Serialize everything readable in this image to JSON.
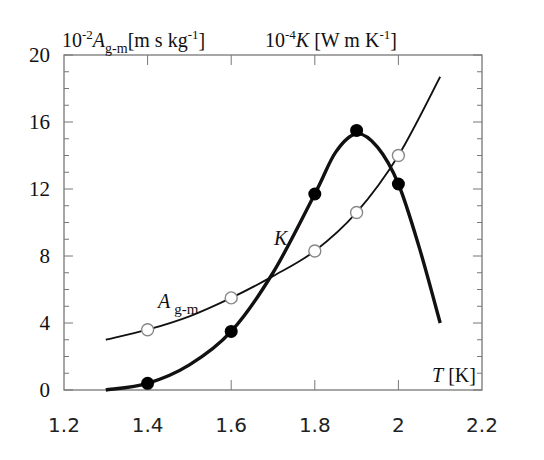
{
  "chart_data": {
    "type": "line",
    "title": "",
    "xlabel": "T [K]",
    "ylabel_left": "10^-2 A_g-m [m s kg^-1]",
    "ylabel_right": "10^-4 K [W m K^-1]",
    "xlim": [
      1.2,
      2.2
    ],
    "ylim": [
      0,
      20
    ],
    "x_ticks": [
      "1.2",
      "1.4",
      "1.6",
      "1.8",
      "2",
      "2.2"
    ],
    "y_ticks": [
      "0",
      "4",
      "8",
      "12",
      "16",
      "20"
    ],
    "grid": false,
    "series": [
      {
        "name": "A_g-m",
        "marker": "open-circle",
        "line_weight": "thin",
        "points": [
          {
            "x": 1.4,
            "y": 3.6
          },
          {
            "x": 1.6,
            "y": 5.5
          },
          {
            "x": 1.8,
            "y": 8.3
          },
          {
            "x": 1.9,
            "y": 10.6
          },
          {
            "x": 2.0,
            "y": 14.0
          }
        ],
        "curve": [
          [
            1.3,
            3.0
          ],
          [
            1.4,
            3.6
          ],
          [
            1.5,
            4.4
          ],
          [
            1.6,
            5.5
          ],
          [
            1.7,
            6.8
          ],
          [
            1.8,
            8.3
          ],
          [
            1.9,
            10.6
          ],
          [
            2.0,
            14.0
          ],
          [
            2.1,
            18.7
          ]
        ]
      },
      {
        "name": "K",
        "marker": "filled-circle",
        "line_weight": "thick",
        "points": [
          {
            "x": 1.4,
            "y": 0.4
          },
          {
            "x": 1.6,
            "y": 3.5
          },
          {
            "x": 1.8,
            "y": 11.7
          },
          {
            "x": 1.9,
            "y": 15.5
          },
          {
            "x": 2.0,
            "y": 12.3
          }
        ],
        "curve": [
          [
            1.3,
            0.0
          ],
          [
            1.4,
            0.4
          ],
          [
            1.5,
            1.5
          ],
          [
            1.6,
            3.5
          ],
          [
            1.7,
            7.0
          ],
          [
            1.8,
            11.7
          ],
          [
            1.85,
            14.2
          ],
          [
            1.9,
            15.3
          ],
          [
            1.95,
            14.5
          ],
          [
            2.0,
            12.3
          ],
          [
            2.05,
            8.5
          ],
          [
            2.1,
            4.0
          ]
        ]
      }
    ],
    "annotations": [
      {
        "text": "K",
        "x": 1.67,
        "y": 9.0
      },
      {
        "text": "A_g-m",
        "x": 1.45,
        "y": 5.0
      },
      {
        "text": "T [K]",
        "x": 2.1,
        "y": 0.7
      }
    ]
  },
  "labels": {
    "left_axis_prefix": "10",
    "left_axis_exp": "-2",
    "left_axis_var": "A",
    "left_axis_sub": "g-m",
    "left_axis_unit": "[m s kg",
    "left_axis_unit_exp": "-1",
    "left_axis_unit_close": "]",
    "right_axis_prefix": "10",
    "right_axis_exp": "-4",
    "right_axis_var": "K",
    "right_axis_unit": " [W m K",
    "right_axis_unit_exp": "-1",
    "right_axis_unit_close": "]",
    "curve_k": "K",
    "curve_a_var": "A",
    "curve_a_sub": "g-m",
    "x_axis_var": "T",
    "x_axis_unit": " [K]"
  }
}
